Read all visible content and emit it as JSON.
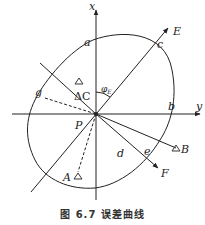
{
  "figure": {
    "caption": "图 6.7  误差曲线",
    "axes": {
      "x_label": "x",
      "y_label": "y"
    },
    "origin_label": "P",
    "rays": {
      "E": "E",
      "F": "F"
    },
    "stations": {
      "A": "A",
      "B": "B",
      "C": "ΔC",
      "C_marker": "Δ"
    },
    "curve_points": {
      "a": "a",
      "b": "b",
      "c": "c",
      "d": "d",
      "e": "e",
      "g": "g"
    },
    "angle": {
      "symbol": "φ",
      "subscript": "E"
    },
    "colors": {
      "line": "#222222",
      "background": "#ffffff"
    }
  }
}
